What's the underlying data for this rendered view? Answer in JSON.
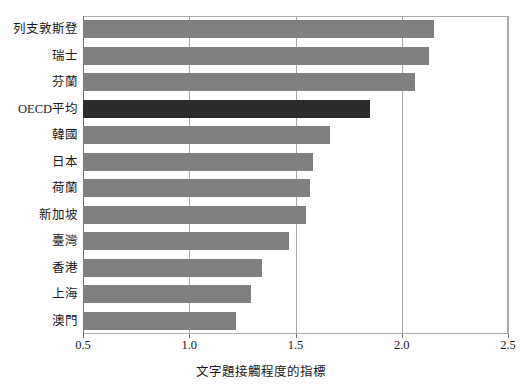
{
  "clipped_caption": "",
  "chart_data": {
    "type": "bar",
    "orientation": "horizontal",
    "title": "",
    "xlabel": "文字題接觸程度的指標",
    "ylabel": "",
    "xlim": [
      0.5,
      2.5
    ],
    "xticks": [
      "0.5",
      "1.0",
      "1.5",
      "2.0",
      "2.5"
    ],
    "xtick_values": [
      0.5,
      1.0,
      1.5,
      2.0,
      2.5
    ],
    "grid": true,
    "legend": "none",
    "categories": [
      "列支敦斯登",
      "瑞士",
      "芬蘭",
      "OECD平均",
      "韓國",
      "日本",
      "荷蘭",
      "新加坡",
      "臺灣",
      "香港",
      "上海",
      "澳門"
    ],
    "values": [
      2.15,
      2.13,
      2.06,
      1.85,
      1.66,
      1.58,
      1.57,
      1.55,
      1.47,
      1.34,
      1.29,
      1.22
    ],
    "highlight_category": "OECD平均",
    "colors": {
      "bar": "#808080",
      "bar_highlight": "#2b2b2b",
      "gridline": "#a9a9a9",
      "axis": "#6e6e6e",
      "text": "#1a1a1a",
      "background": "#ffffff"
    }
  }
}
